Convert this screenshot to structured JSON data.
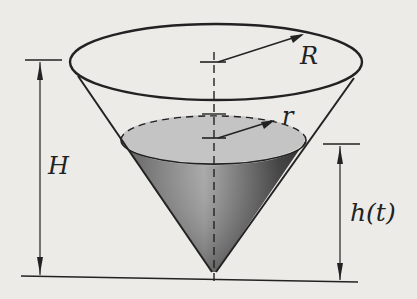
{
  "diagram": {
    "labels": {
      "outer_radius": "R",
      "liquid_radius": "r",
      "height": "H",
      "liquid_height": "h(t)"
    },
    "colors": {
      "background": "#ecebe7",
      "stroke": "#222222",
      "liquid_top": "#c4c4c4",
      "liquid_dark": "#4a4a4a"
    }
  }
}
